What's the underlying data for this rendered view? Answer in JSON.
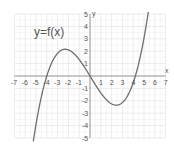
{
  "chart_data": {
    "type": "line",
    "title": "y=f(x)",
    "xlabel": "x",
    "ylabel": "y",
    "xlim": [
      -7,
      7
    ],
    "ylim": [
      -5,
      5
    ],
    "grid": true,
    "x_ticks": [
      -7,
      -6,
      -5,
      -4,
      -3,
      -2,
      -1,
      1,
      2,
      3,
      4,
      5,
      6,
      7
    ],
    "y_ticks": [
      -5,
      -4,
      -3,
      -2,
      -1,
      1,
      2,
      3,
      4,
      5
    ],
    "series": [
      {
        "name": "f(x)",
        "description": "cubic curve with roots at about x=-4, 0, 4.2; local max near (-2.2, 2.1); local min near (2.3, -1.9)",
        "x": [
          -5.3,
          -5,
          -4.5,
          -4,
          -3.5,
          -3,
          -2.5,
          -2.2,
          -2,
          -1.5,
          -1,
          -0.5,
          0,
          0.5,
          1,
          1.5,
          2,
          2.3,
          2.5,
          3,
          3.5,
          4,
          4.2,
          4.5,
          5,
          5.5,
          5.7
        ],
        "y": [
          -5.0,
          -3.9,
          -1.6,
          0.0,
          1.2,
          1.9,
          2.1,
          2.1,
          2.0,
          1.6,
          1.1,
          0.5,
          0.0,
          -0.6,
          -1.1,
          -1.5,
          -1.8,
          -1.9,
          -1.9,
          -1.8,
          -1.4,
          -0.6,
          0.0,
          0.9,
          2.6,
          4.6,
          5.2
        ]
      }
    ],
    "annotations": [
      {
        "text": "y=f(x)",
        "position": "upper-left"
      }
    ]
  },
  "labels": {
    "title": "y=f(x)",
    "x_axis": "x",
    "y_axis": "y",
    "y_top": "5",
    "x_ticks": [
      "-7",
      "-6",
      "-5",
      "-4",
      "-3",
      "-2",
      "-1",
      "1",
      "2",
      "3",
      "4",
      "5",
      "6",
      "7"
    ],
    "y_ticks_pos": [
      "4",
      "3",
      "2",
      "1"
    ],
    "y_ticks_neg": [
      "-1",
      "-2",
      "-3",
      "-4",
      "-5"
    ]
  },
  "colors": {
    "grid": "#e6e6e6",
    "axis": "#9a9a9a",
    "curve": "#6e6e6e",
    "text": "#555555"
  }
}
